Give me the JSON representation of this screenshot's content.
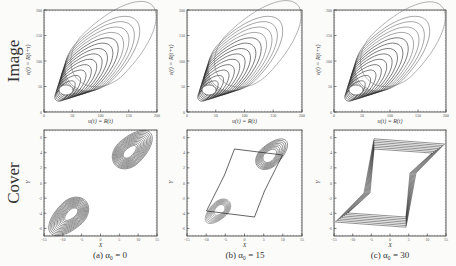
{
  "figure": {
    "row_labels": [
      "Image",
      "Cover"
    ],
    "captions": [
      "(a) α₀ = 0",
      "(b) α₀ = 15",
      "(c) α₀ = 30"
    ],
    "top_axes": {
      "xlabel": "u(t) = R(t)",
      "ylabel": "v(t) = R(t+τ)",
      "xticks": [
        "0",
        "50",
        "100",
        "150",
        "200"
      ],
      "yticks": [
        "0",
        "50",
        "100",
        "150",
        "200"
      ]
    },
    "bottom_axes": {
      "xlabel": "X",
      "ylabel": "Y",
      "xticks": [
        "-15",
        "-10",
        "-5",
        "0",
        "5",
        "10",
        "15"
      ],
      "yticks": [
        "-6",
        "-4",
        "-2",
        "0",
        "2",
        "4",
        "6"
      ]
    },
    "marker_c": "X"
  },
  "chart_data": [
    {
      "type": "line",
      "title": "Image (a) α₀ = 0",
      "xlabel": "u(t) = R(t)",
      "ylabel": "v(t) = R(t+τ)",
      "xlim": [
        0,
        200
      ],
      "ylim": [
        0,
        200
      ],
      "description": "phase-space delay embedding; nested elongated loops along diagonal from (0,0) to about (190,190)"
    },
    {
      "type": "line",
      "title": "Image (b) α₀ = 15",
      "xlabel": "u(t) = R(t)",
      "ylabel": "v(t) = R(t+τ)",
      "xlim": [
        0,
        200
      ],
      "ylim": [
        0,
        200
      ]
    },
    {
      "type": "line",
      "title": "Image (c) α₀ = 30",
      "xlabel": "u(t) = R(t)",
      "ylabel": "v(t) = R(t+τ)",
      "xlim": [
        0,
        200
      ],
      "ylim": [
        0,
        200
      ]
    },
    {
      "type": "line",
      "title": "Cover (a) α₀ = 0",
      "xlabel": "X",
      "ylabel": "Y",
      "xlim": [
        -15,
        15
      ],
      "ylim": [
        -7,
        7
      ],
      "description": "two separate symmetric lobes centered near (-9,-3) and (9,3)"
    },
    {
      "type": "line",
      "title": "Cover (b) α₀ = 15",
      "xlabel": "X",
      "ylabel": "Y",
      "xlim": [
        -15,
        15
      ],
      "ylim": [
        -7,
        7
      ],
      "description": "lobes connected forming a hexagonal band"
    },
    {
      "type": "line",
      "title": "Cover (c) α₀ = 30",
      "xlabel": "X",
      "ylabel": "Y",
      "xlim": [
        -15,
        15
      ],
      "ylim": [
        -7,
        7
      ],
      "description": "single large rotated loop with corner cusps"
    }
  ]
}
